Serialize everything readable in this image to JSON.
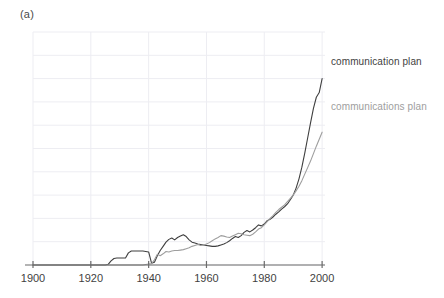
{
  "panel": {
    "label": "(a)"
  },
  "axis": {
    "x_ticks": [
      1900,
      1920,
      1940,
      1960,
      1980,
      2000
    ],
    "x_tick_labels": [
      "1900",
      "1920",
      "1940",
      "1960",
      "1980",
      "2000"
    ]
  },
  "legend": {
    "series1_label": "communication plan",
    "series2_label": "communications plan"
  },
  "colors": {
    "series1": "#3f3f3f",
    "series2": "#9e9e9e",
    "grid": "#ededf2",
    "axis": "#6b6b6b",
    "text": "#3f3f3f"
  },
  "chart_data": {
    "type": "line",
    "title": "(a)",
    "xlabel": "",
    "ylabel": "",
    "xlim": [
      1900,
      2001
    ],
    "ylim": [
      0,
      1.0
    ],
    "grid": true,
    "legend_position": "right-inline",
    "xticks": [
      1900,
      1920,
      1940,
      1960,
      1980,
      2000
    ],
    "yticks": [],
    "x": [
      1900,
      1901,
      1902,
      1903,
      1904,
      1905,
      1906,
      1907,
      1908,
      1909,
      1910,
      1911,
      1912,
      1913,
      1914,
      1915,
      1916,
      1917,
      1918,
      1919,
      1920,
      1921,
      1922,
      1923,
      1924,
      1925,
      1926,
      1927,
      1928,
      1929,
      1930,
      1931,
      1932,
      1933,
      1934,
      1935,
      1936,
      1937,
      1938,
      1939,
      1940,
      1941,
      1942,
      1943,
      1944,
      1945,
      1946,
      1947,
      1948,
      1949,
      1950,
      1951,
      1952,
      1953,
      1954,
      1955,
      1956,
      1957,
      1958,
      1959,
      1960,
      1961,
      1962,
      1963,
      1964,
      1965,
      1966,
      1967,
      1968,
      1969,
      1970,
      1971,
      1972,
      1973,
      1974,
      1975,
      1976,
      1977,
      1978,
      1979,
      1980,
      1981,
      1982,
      1983,
      1984,
      1985,
      1986,
      1987,
      1988,
      1989,
      1990,
      1991,
      1992,
      1993,
      1994,
      1995,
      1996,
      1997,
      1998,
      1999,
      2000
    ],
    "series": [
      {
        "name": "communication plan",
        "color": "#3f3f3f",
        "values": [
          0.0,
          0.0,
          0.0,
          0.0,
          0.0,
          0.0,
          0.0,
          0.0,
          0.0,
          0.0,
          0.0,
          0.0,
          0.0,
          0.0,
          0.0,
          0.0,
          0.0,
          0.0,
          0.0,
          0.0,
          0.0,
          0.0,
          0.0,
          0.0,
          0.0,
          0.0,
          0.003,
          0.018,
          0.028,
          0.03,
          0.03,
          0.03,
          0.03,
          0.052,
          0.06,
          0.06,
          0.06,
          0.06,
          0.06,
          0.058,
          0.056,
          0.008,
          0.012,
          0.04,
          0.062,
          0.08,
          0.098,
          0.11,
          0.116,
          0.108,
          0.118,
          0.124,
          0.13,
          0.122,
          0.108,
          0.098,
          0.094,
          0.09,
          0.088,
          0.086,
          0.084,
          0.082,
          0.08,
          0.08,
          0.082,
          0.086,
          0.09,
          0.096,
          0.104,
          0.114,
          0.122,
          0.118,
          0.126,
          0.14,
          0.148,
          0.142,
          0.15,
          0.16,
          0.172,
          0.168,
          0.176,
          0.19,
          0.196,
          0.206,
          0.218,
          0.228,
          0.24,
          0.25,
          0.262,
          0.28,
          0.3,
          0.33,
          0.37,
          0.42,
          0.48,
          0.545,
          0.61,
          0.672,
          0.72,
          0.74,
          0.8
        ]
      },
      {
        "name": "communications plan",
        "color": "#9e9e9e",
        "values": [
          0.0,
          0.0,
          0.0,
          0.0,
          0.0,
          0.0,
          0.0,
          0.0,
          0.0,
          0.0,
          0.0,
          0.0,
          0.0,
          0.0,
          0.0,
          0.0,
          0.0,
          0.0,
          0.0,
          0.0,
          0.0,
          0.0,
          0.0,
          0.0,
          0.0,
          0.0,
          0.0,
          0.0,
          0.0,
          0.0,
          0.0,
          0.0,
          0.0,
          0.0,
          0.0,
          0.0,
          0.0,
          0.0,
          0.0,
          0.002,
          0.004,
          0.006,
          0.022,
          0.046,
          0.04,
          0.048,
          0.058,
          0.056,
          0.06,
          0.062,
          0.062,
          0.064,
          0.066,
          0.07,
          0.074,
          0.08,
          0.084,
          0.088,
          0.084,
          0.086,
          0.09,
          0.096,
          0.104,
          0.112,
          0.118,
          0.126,
          0.124,
          0.12,
          0.118,
          0.124,
          0.13,
          0.136,
          0.134,
          0.13,
          0.128,
          0.126,
          0.132,
          0.142,
          0.154,
          0.16,
          0.172,
          0.186,
          0.2,
          0.212,
          0.226,
          0.238,
          0.248,
          0.258,
          0.272,
          0.286,
          0.3,
          0.318,
          0.338,
          0.362,
          0.39,
          0.418,
          0.446,
          0.478,
          0.51,
          0.54,
          0.57
        ]
      }
    ]
  }
}
